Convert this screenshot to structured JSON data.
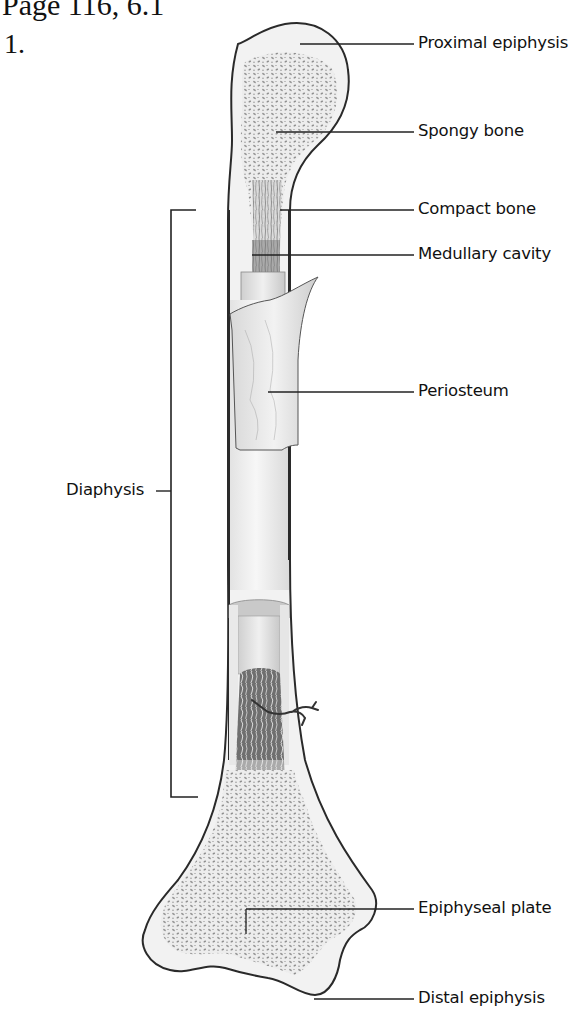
{
  "header": {
    "title": "Page 116, 6.1",
    "item_number": "1."
  },
  "figure": {
    "labels": {
      "proximal_epiphysis": "Proximal epiphysis",
      "spongy_bone": "Spongy bone",
      "compact_bone": "Compact bone",
      "medullary_cavity": "Medullary cavity",
      "periosteum": "Periosteum",
      "diaphysis": "Diaphysis",
      "epiphyseal_plate": "Epiphyseal plate",
      "distal_epiphysis": "Distal epiphysis"
    }
  },
  "colors": {
    "outline": "#2a2a2a",
    "bone_fill": "#f1f1f1",
    "spongy": "#9a9a9a",
    "cavity": "#6e6e6e",
    "leader": "#222222"
  }
}
